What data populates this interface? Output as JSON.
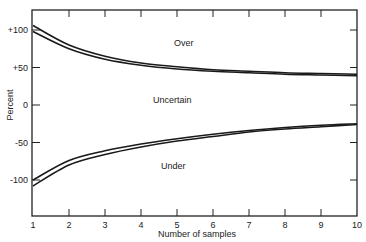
{
  "chart_data": {
    "type": "line",
    "title": "",
    "xlabel": "Number of samples",
    "ylabel": "Percent",
    "xlim": [
      1,
      10
    ],
    "ylim": [
      -150,
      130
    ],
    "grid": false,
    "x": [
      1,
      2,
      3,
      4,
      5,
      6,
      7,
      8,
      9,
      10
    ],
    "x_ticks": [
      "1",
      "2",
      "3",
      "4",
      "5",
      "6",
      "7",
      "8",
      "9",
      "10"
    ],
    "y_ticks": [
      "+100",
      "+50",
      "0",
      "-50",
      "-100"
    ],
    "series": [
      {
        "name": "Over (outer)",
        "values": [
          106,
          80,
          65,
          56,
          51,
          47,
          45,
          43,
          42,
          41
        ]
      },
      {
        "name": "Over (inner)",
        "values": [
          98,
          75,
          61,
          53,
          48,
          45,
          43,
          41,
          40,
          39
        ]
      },
      {
        "name": "Under (inner)",
        "values": [
          -100,
          -74,
          -61,
          -52,
          -45,
          -39,
          -34,
          -30,
          -27,
          -25
        ]
      },
      {
        "name": "Under (outer)",
        "values": [
          -108,
          -80,
          -66,
          -56,
          -48,
          -42,
          -36,
          -32,
          -29,
          -26
        ]
      }
    ],
    "annotations": [
      "Over",
      "Uncertain",
      "Under"
    ]
  },
  "labels": {
    "over": "Over",
    "uncertain": "Uncertain",
    "under": "Under",
    "xlabel": "Number of samples",
    "ylabel": "Percent",
    "y_ticks": [
      "+100",
      "+50",
      "0",
      "-50",
      "-100"
    ],
    "x_ticks": [
      "1",
      "2",
      "3",
      "4",
      "5",
      "6",
      "7",
      "8",
      "9",
      "10"
    ]
  }
}
